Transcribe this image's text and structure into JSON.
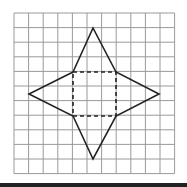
{
  "diagram": {
    "title": "",
    "grid": {
      "cols": 11,
      "rows": 11,
      "origin": [
        14,
        13
      ],
      "cell": 14.6,
      "line_color": "#9a9a9a"
    },
    "net": {
      "square": [
        [
          73,
          72
        ],
        [
          116,
          72
        ],
        [
          116,
          116
        ],
        [
          73,
          116
        ]
      ],
      "apexes": {
        "top": [
          93,
          28
        ],
        "right": [
          159,
          94
        ],
        "bottom": [
          93,
          159
        ],
        "left": [
          29,
          94
        ]
      },
      "stroke": "#222222"
    }
  }
}
